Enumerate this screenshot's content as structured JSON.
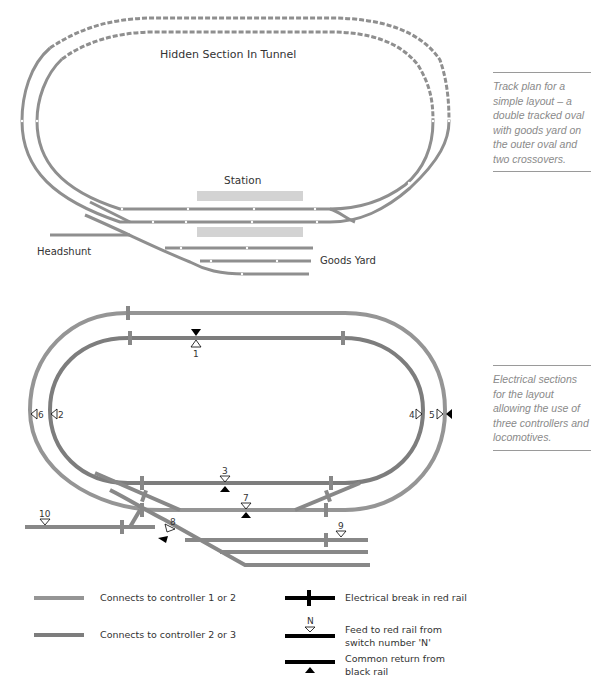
{
  "track_plan": {
    "labels": {
      "hidden_section": "Hidden Section In Tunnel",
      "station": "Station",
      "headshunt": "Headshunt",
      "goods_yard": "Goods Yard"
    },
    "caption": "Track plan for a simple layout – a double tracked oval with goods yard on the outer oval and two crossovers."
  },
  "electrical_plan": {
    "feed_numbers": {
      "f1": "1",
      "f2": "2",
      "f3": "3",
      "f4": "4",
      "f5": "5",
      "f6": "6",
      "f7": "7",
      "f8": "8",
      "f9": "9",
      "f10": "10"
    },
    "caption": "Electrical sections for the layout allowing the use of three controllers and locomotives."
  },
  "legend": {
    "controller_1_2": "Connects to controller 1 or 2",
    "controller_2_3": "Connects to controller 2 or 3",
    "break": "Electrical break in red rail",
    "feed_symbol": "N",
    "feed": "Feed to red rail from switch number 'N'",
    "return": "Common return from black rail"
  },
  "colors": {
    "track": "#8f8f8f",
    "track_dark": "#7d7d7d",
    "platform": "#d0d0d0",
    "symbol": "#000000"
  }
}
